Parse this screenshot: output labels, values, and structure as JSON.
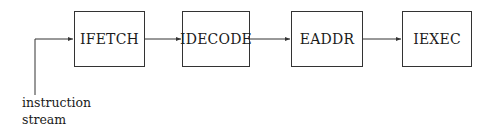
{
  "diagram": {
    "type": "pipeline-flow",
    "stages": [
      {
        "id": "ifetch",
        "label": "IFETCH",
        "x": 74,
        "y": 11,
        "w": 71,
        "h": 56
      },
      {
        "id": "idecode",
        "label": "IDECODE",
        "x": 182,
        "y": 11,
        "w": 68,
        "h": 56
      },
      {
        "id": "eaddr",
        "label": "EADDR",
        "x": 291,
        "y": 11,
        "w": 72,
        "h": 56
      },
      {
        "id": "iexec",
        "label": "IEXEC",
        "x": 402,
        "y": 11,
        "w": 70,
        "h": 56
      }
    ],
    "input": {
      "label_line1": "instruction",
      "label_line2": "stream"
    },
    "edges": [
      {
        "from": "input",
        "to": "ifetch"
      },
      {
        "from": "ifetch",
        "to": "idecode"
      },
      {
        "from": "idecode",
        "to": "eaddr"
      },
      {
        "from": "eaddr",
        "to": "iexec"
      }
    ],
    "line_color": "#333333"
  }
}
